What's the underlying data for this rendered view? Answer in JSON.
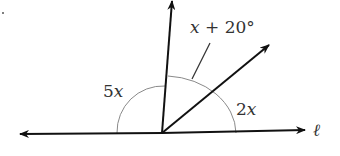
{
  "diagram": {
    "type": "angles on a straight line",
    "line_label": "ℓ",
    "angles": [
      {
        "id": "left",
        "label": "5x"
      },
      {
        "id": "middle",
        "label": "x + 20°"
      },
      {
        "id": "right",
        "label": "2x"
      }
    ],
    "colors": {
      "rays": "#111111",
      "arcs": "#8a8a8a",
      "text": "#333333"
    }
  }
}
